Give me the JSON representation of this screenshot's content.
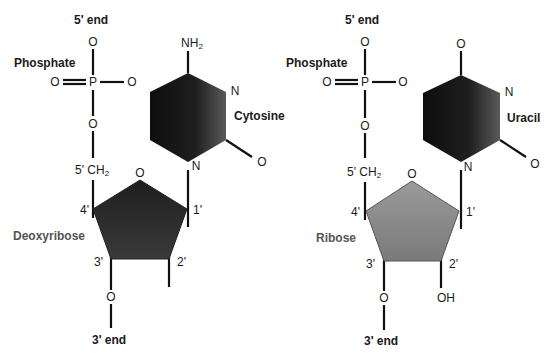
{
  "colors": {
    "line": "#111111",
    "deoxyribose_fill_dark": "#1e1e1e",
    "deoxyribose_fill_light": "#555555",
    "ribose_fill_dark": "#6a6a6a",
    "ribose_fill_light": "#b5b5b5",
    "base_fill_dark": "#0d0d0d",
    "base_fill_light": "#5a5a5a",
    "sugar_label": "#555555"
  },
  "left": {
    "name": "DNA nucleotide (deoxycytidine monophosphate)",
    "five_end": "5' end",
    "phosphate_label": "Phosphate",
    "phosphate": {
      "p": "P",
      "o_top": "O",
      "o_left": "O",
      "o_right": "O",
      "o_bottom": "O"
    },
    "ch2": {
      "prefix": "5' CH",
      "sub": "2"
    },
    "sugar": {
      "name": "Deoxyribose",
      "ring_o": "O",
      "c1": "1'",
      "c2": "2'",
      "c3": "3'",
      "c4": "4'",
      "c3_o": "O",
      "c2_group": ""
    },
    "base": {
      "name": "Cytosine",
      "top_group": {
        "main": "NH",
        "sub": "2"
      },
      "n_upper": "N",
      "n_glycosidic": "N",
      "carbonyl_o": "O"
    },
    "three_end": "3' end"
  },
  "right": {
    "name": "RNA nucleotide (uridine monophosphate)",
    "five_end": "5' end",
    "phosphate_label": "Phosphate",
    "phosphate": {
      "p": "P",
      "o_top": "O",
      "o_left": "O",
      "o_right": "O",
      "o_bottom": "O"
    },
    "ch2": {
      "prefix": "5' CH",
      "sub": "2"
    },
    "sugar": {
      "name": "Ribose",
      "ring_o": "O",
      "c1": "1'",
      "c2": "2'",
      "c3": "3'",
      "c4": "4'",
      "c3_o": "O",
      "c2_group": "OH"
    },
    "base": {
      "name": "Uracil",
      "top_group": {
        "main": "O",
        "sub": ""
      },
      "n_upper": "N",
      "n_glycosidic": "N",
      "carbonyl_o": "O"
    },
    "three_end": "3' end"
  }
}
